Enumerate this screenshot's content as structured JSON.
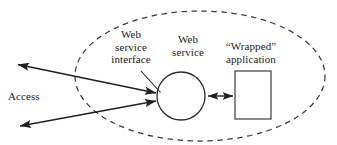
{
  "diagram": {
    "boundary": {
      "name": "service-boundary-ellipse",
      "style": "dashed-ellipse",
      "color": "#3a3a3a"
    },
    "labels": {
      "web_service_interface": {
        "line1": "Web",
        "line2": "service",
        "line3": "interface"
      },
      "web_service": {
        "line1": "Web",
        "line2": "service"
      },
      "wrapped_application": {
        "line1": "“Wrapped”",
        "line2": "application"
      },
      "access": "Access"
    },
    "nodes": [
      {
        "id": "web-service-circle",
        "shape": "circle",
        "label_ref": "web_service",
        "cx": 181,
        "cy": 96,
        "r": 24,
        "stroke": "#2b2b2b"
      },
      {
        "id": "wrapped-application-rect",
        "shape": "rectangle",
        "label_ref": "wrapped_application",
        "x": 235,
        "y": 71,
        "width": 36,
        "height": 48,
        "stroke": "#4a4a4a"
      }
    ],
    "connectors": [
      {
        "id": "access-arrow-upper",
        "from": [
          16,
          64
        ],
        "to": [
          158,
          93
        ],
        "arrowheads": "both",
        "label_ref": "access"
      },
      {
        "id": "access-arrow-lower",
        "from": [
          18,
          126
        ],
        "to": [
          158,
          101
        ],
        "arrowheads": "both",
        "label_ref": "access"
      },
      {
        "id": "service-to-application-arrow",
        "from": [
          206,
          96
        ],
        "to": [
          234,
          96
        ],
        "arrowheads": "both"
      },
      {
        "id": "interface-leader-line",
        "from": [
          141,
          71
        ],
        "to": [
          161,
          93
        ],
        "arrowheads": "none",
        "label_ref": "web_service_interface"
      }
    ],
    "colors": {
      "stroke": "#2b2b2b",
      "dashed_stroke": "#3a3a3a",
      "text": "#1a1a1a",
      "background": "#ffffff"
    }
  }
}
